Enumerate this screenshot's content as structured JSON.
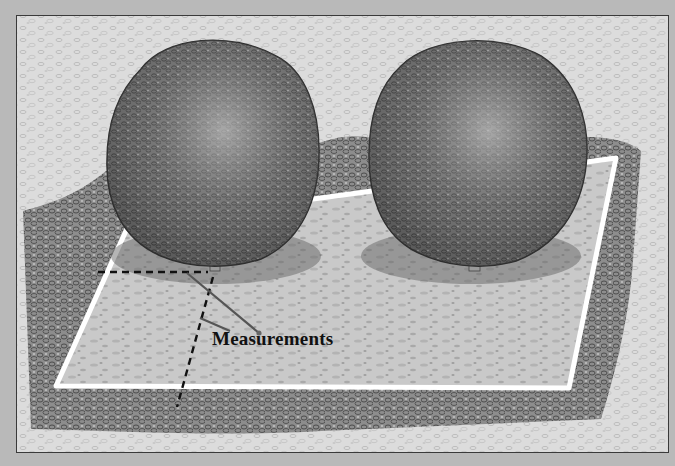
{
  "figure": {
    "labels": {
      "measurements": "Measurements"
    },
    "elements": {
      "trees": [
        "left-tree",
        "right-tree"
      ],
      "bed_outline": "white-rectangle-outline",
      "measurement_lines": [
        "dashed-horizontal-line",
        "dashed-diagonal-line"
      ],
      "leader_lines": 2
    },
    "colors": {
      "frame_border": "#3a3a3a",
      "outer_margin": "#b9b9b9",
      "bed_outline": "#ffffff",
      "foliage_dark": "#4a4a4a",
      "gravel_light": "#d6d6d6"
    }
  }
}
